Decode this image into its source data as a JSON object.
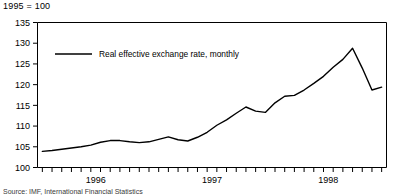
{
  "figure": {
    "index_note": "1995 = 100",
    "source_note": "Source:  IMF, International Financial Statistics"
  },
  "chart_data": {
    "type": "line",
    "title": "",
    "subtitle": "1995 = 100",
    "xlabel": "",
    "ylabel": "",
    "ylim": [
      100,
      135
    ],
    "yticks": [
      100,
      105,
      110,
      115,
      120,
      125,
      130,
      135
    ],
    "ytick_labels": [
      "100",
      "105",
      "110",
      "115",
      "120",
      "125",
      "130",
      "135"
    ],
    "xlim": [
      "1996-01",
      "1998-12"
    ],
    "xtick_labels": [
      "1996",
      "1997",
      "1998"
    ],
    "xtick_label_positions": [
      6,
      18,
      30
    ],
    "minor_ticks": "monthly",
    "grid": false,
    "legend_position": "inside-top-left",
    "series": [
      {
        "name": "Real effective exchange rate, monthly",
        "color": "#000000",
        "x": [
          "1996-01",
          "1996-02",
          "1996-03",
          "1996-04",
          "1996-05",
          "1996-06",
          "1996-07",
          "1996-08",
          "1996-09",
          "1996-10",
          "1996-11",
          "1996-12",
          "1997-01",
          "1997-02",
          "1997-03",
          "1997-04",
          "1997-05",
          "1997-06",
          "1997-07",
          "1997-08",
          "1997-09",
          "1997-10",
          "1997-11",
          "1997-12",
          "1998-01",
          "1998-02",
          "1998-03",
          "1998-04",
          "1998-05",
          "1998-06",
          "1998-07",
          "1998-08",
          "1998-09",
          "1998-10",
          "1998-11",
          "1998-12"
        ],
        "values": [
          103.9,
          104.1,
          104.4,
          104.7,
          105.0,
          105.4,
          106.1,
          106.5,
          106.5,
          106.2,
          106.0,
          106.2,
          106.8,
          107.4,
          106.7,
          106.4,
          107.3,
          108.5,
          110.2,
          111.5,
          113.1,
          114.6,
          113.6,
          113.3,
          115.6,
          117.2,
          117.4,
          118.7,
          120.3,
          122.0,
          124.2,
          126.1,
          128.8,
          124.0,
          118.7,
          119.4
        ]
      }
    ]
  },
  "legend": {
    "entries": [
      {
        "label": "Real effective exchange rate, monthly",
        "color": "#000000"
      }
    ]
  }
}
